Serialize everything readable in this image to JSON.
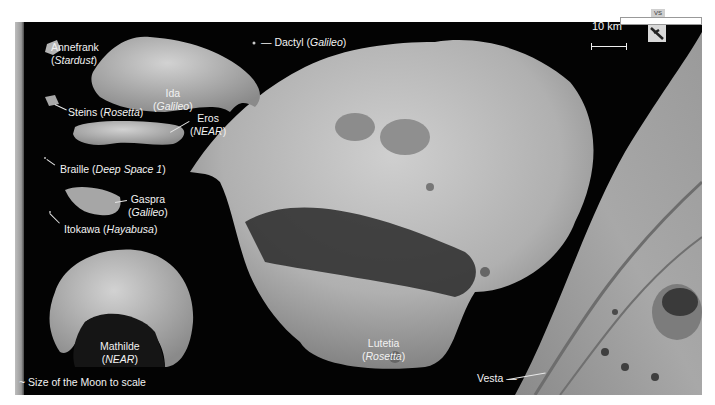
{
  "figure": {
    "scale_label": "10 km",
    "strip_tag": "VS",
    "labels": {
      "annefrank": {
        "name": "Annefrank",
        "mission": "Stardust"
      },
      "ida": {
        "name": "Ida",
        "mission": "Galileo"
      },
      "dactyl": {
        "name": "Dactyl",
        "mission": "Galileo"
      },
      "steins": {
        "name": "Steins",
        "mission": "Rosetta"
      },
      "eros": {
        "name": "Eros",
        "mission": "NEAR"
      },
      "braille": {
        "name": "Braille",
        "mission": "Deep Space 1"
      },
      "gaspra": {
        "name": "Gaspra",
        "mission": "Galileo"
      },
      "itokawa": {
        "name": "Itokawa",
        "mission": "Hayabusa"
      },
      "mathilde": {
        "name": "Mathilde",
        "mission": "NEAR"
      },
      "lutetia": {
        "name": "Lutetia",
        "mission": "Rosetta"
      },
      "vesta": {
        "name": "Vesta"
      },
      "moon": {
        "text": "Size of the Moon to scale"
      }
    },
    "colors": {
      "background": "#030303",
      "page": "#ffffff",
      "label": "#f2f2f2",
      "rock_light": "#bdbdbd",
      "rock_dark": "#5a5a5a"
    }
  }
}
